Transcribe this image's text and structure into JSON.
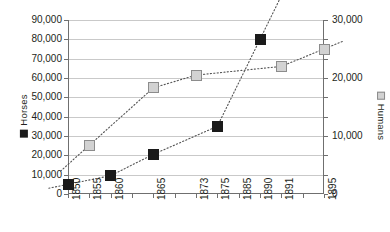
{
  "legend": {
    "horses": {
      "label": "Horses",
      "marker": "filled-square",
      "color": "#1a1a1a"
    },
    "humans": {
      "label": "Humans",
      "marker": "outlined-square",
      "color": "#d2d2d2"
    }
  },
  "axes": {
    "left": {
      "title": "Horses",
      "ticks": [
        "0",
        "10,000",
        "20,000",
        "30,000",
        "40,000",
        "50,000",
        "60,000",
        "70,000",
        "80,000",
        "90,000"
      ]
    },
    "right": {
      "title": "Humans",
      "ticks": [
        "0",
        "10,000",
        "20,000",
        "30,000"
      ]
    },
    "bottom": {
      "ticks": [
        "1850",
        "1855",
        "1860",
        "",
        "1865",
        "",
        "1873",
        "1875",
        "1885",
        "1890",
        "1891",
        "",
        "1895"
      ]
    }
  },
  "chart_data": {
    "type": "scatter",
    "title": "",
    "xlabel": "",
    "ylabel": "Horses",
    "y2label": "Humans",
    "grid": true,
    "legend_position": "left-and-right-vertical",
    "x": [
      "1850",
      "1855",
      "1860",
      "1865",
      "1873",
      "1875",
      "1885",
      "1890",
      "1891",
      "1895"
    ],
    "xlim": [
      1850,
      1895
    ],
    "ylim": [
      0,
      90000
    ],
    "y2lim": [
      0,
      30000
    ],
    "yticks": [
      0,
      10000,
      20000,
      30000,
      40000,
      50000,
      60000,
      70000,
      80000,
      90000
    ],
    "y2ticks": [
      0,
      10000,
      20000,
      30000
    ],
    "series": [
      {
        "name": "Horses",
        "axis": "left",
        "marker": "filled-square",
        "color": "#1a1a1a",
        "line": "dotted",
        "points": [
          {
            "x": "1850",
            "y": 5000
          },
          {
            "x": "1860",
            "y": 9500
          },
          {
            "x": "1865",
            "y": 20500
          },
          {
            "x": "1875",
            "y": 35000
          },
          {
            "x": "1890",
            "y": 80000
          }
        ]
      },
      {
        "name": "Humans",
        "axis": "right",
        "marker": "outlined-square",
        "color": "#d2d2d2",
        "line": "dotted",
        "points": [
          {
            "x": "1855",
            "y": 8400
          },
          {
            "x": "1865",
            "y": 18300
          },
          {
            "x": "1873",
            "y": 20500
          },
          {
            "x": "1891",
            "y": 22000
          },
          {
            "x": "1895",
            "y": 25000
          }
        ]
      }
    ]
  }
}
